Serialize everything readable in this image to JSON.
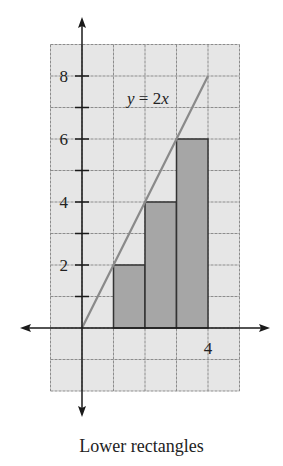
{
  "chart_data": {
    "type": "bar",
    "title": "",
    "caption": "Lower rectangles",
    "function": {
      "label": "y = 2x",
      "slope": 2,
      "x_range": [
        0,
        4
      ]
    },
    "rectangles": [
      {
        "x0": 1,
        "x1": 2,
        "height": 2
      },
      {
        "x0": 2,
        "x1": 3,
        "height": 4
      },
      {
        "x0": 3,
        "x1": 4,
        "height": 6
      }
    ],
    "categories": [
      "[1,2]",
      "[2,3]",
      "[3,4]"
    ],
    "values": [
      2,
      4,
      6
    ],
    "xlabel": "",
    "ylabel": "",
    "xlim": [
      -1,
      5
    ],
    "ylim": [
      -2,
      9
    ],
    "x_tick_labels": [
      {
        "value": 4,
        "label": "4"
      }
    ],
    "y_tick_labels": [
      {
        "value": 2,
        "label": "2"
      },
      {
        "value": 4,
        "label": "4"
      },
      {
        "value": 6,
        "label": "6"
      },
      {
        "value": 8,
        "label": "8"
      }
    ],
    "grid": true,
    "legend": null
  },
  "colors": {
    "grid_fill": "#e6e6e6",
    "grid_line": "#8c8c8c",
    "rect_fill": "#a6a6a6",
    "rect_stroke": "#333333",
    "axis": "#1a1a1a",
    "function_line": "#8a8a8a"
  }
}
